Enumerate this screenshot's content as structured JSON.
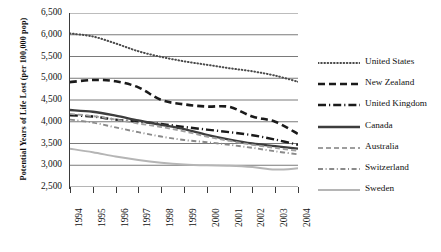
{
  "chart_data": {
    "type": "line",
    "title": "",
    "xlabel": "",
    "ylabel": "Potential Years of Life Lost (per 100,000 pop)",
    "x": [
      1994,
      1995,
      1996,
      1997,
      1998,
      1999,
      2000,
      2001,
      2002,
      2003,
      2004
    ],
    "categories": [
      "1994",
      "1995",
      "1996",
      "1997",
      "1998",
      "1999",
      "2000",
      "2001",
      "2002",
      "2003",
      "2004"
    ],
    "ylim": [
      2500,
      6500
    ],
    "yticks": [
      2500,
      3000,
      3500,
      4000,
      4500,
      5000,
      5500,
      6000,
      6500
    ],
    "ytick_labels": [
      "2,500",
      "3,000",
      "3,500",
      "4,000",
      "4,500",
      "5,000",
      "5,500",
      "6,000",
      "6,500"
    ],
    "grid": "horizontal",
    "legend_position": "right",
    "series": [
      {
        "name": "United States",
        "style": "dotted",
        "color": "#4a4a4a",
        "values": [
          6030,
          5960,
          5800,
          5620,
          5490,
          5390,
          5310,
          5230,
          5160,
          5060,
          4920
        ]
      },
      {
        "name": "New Zealand",
        "style": "dashed",
        "color": "#1a1a1a",
        "values": [
          4910,
          4960,
          4930,
          4790,
          4500,
          4400,
          4350,
          4340,
          4120,
          4000,
          3720
        ]
      },
      {
        "name": "United Kingdom",
        "style": "dash-dot",
        "color": "#1a1a1a",
        "values": [
          4150,
          4120,
          4050,
          4000,
          3950,
          3880,
          3820,
          3760,
          3690,
          3590,
          3470
        ]
      },
      {
        "name": "Canada",
        "style": "solid",
        "color": "#3d3d3d",
        "values": [
          4270,
          4230,
          4140,
          4030,
          3930,
          3830,
          3700,
          3590,
          3500,
          3440,
          3380
        ]
      },
      {
        "name": "Australia",
        "style": "dashed-light",
        "color": "#9e9e9e",
        "values": [
          4180,
          4130,
          4050,
          3960,
          3880,
          3780,
          3660,
          3560,
          3470,
          3400,
          3330
        ]
      },
      {
        "name": "Switzerland",
        "style": "dash-dot-light",
        "color": "#8a8a8a",
        "values": [
          4050,
          3980,
          3870,
          3760,
          3660,
          3580,
          3530,
          3470,
          3400,
          3320,
          3250
        ]
      },
      {
        "name": "Sweden",
        "style": "solid-light",
        "color": "#b5b5b5",
        "values": [
          3380,
          3300,
          3200,
          3120,
          3060,
          3020,
          3000,
          2990,
          2960,
          2900,
          2930
        ]
      }
    ]
  },
  "legend": {
    "items": [
      {
        "label": "United States"
      },
      {
        "label": "New Zealand"
      },
      {
        "label": "United Kingdom"
      },
      {
        "label": "Canada"
      },
      {
        "label": "Australia"
      },
      {
        "label": "Switzerland"
      },
      {
        "label": "Sweden"
      }
    ]
  }
}
